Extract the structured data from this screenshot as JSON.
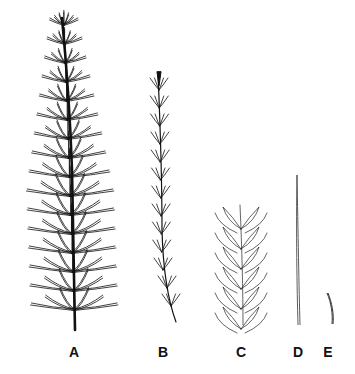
{
  "figure": {
    "panels": [
      {
        "id": "A",
        "label": "A",
        "x": 74,
        "description": "main stem with whorled branches"
      },
      {
        "id": "B",
        "label": "B",
        "x": 163,
        "description": "slender branch with small whorls"
      },
      {
        "id": "C",
        "label": "C",
        "x": 241,
        "description": "close-up of branch segment with leaves"
      },
      {
        "id": "D",
        "label": "D",
        "x": 298,
        "description": "single long needle"
      },
      {
        "id": "E",
        "label": "E",
        "x": 328,
        "description": "single short curved leaf"
      }
    ],
    "label_y": 344,
    "colors": {
      "ink": "#111111",
      "background": "#ffffff"
    }
  }
}
